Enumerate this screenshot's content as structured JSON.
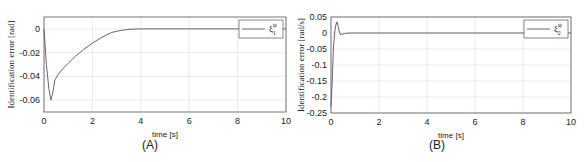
{
  "chart_data": [
    {
      "type": "line",
      "panel_label": "(A)",
      "xlabel": "time [s]",
      "ylabel": "Identification error [rad]",
      "xlim": [
        0,
        10
      ],
      "ylim": [
        -0.07,
        0.01
      ],
      "xticks": [
        "0",
        "2",
        "4",
        "6",
        "8",
        "10"
      ],
      "yticks": [
        "0",
        "-0.02",
        "-0.04",
        "-0.06"
      ],
      "grid": true,
      "legend_position": "upper right",
      "series": [
        {
          "name": "ξ1^ψ",
          "x": [
            0,
            0.1,
            0.2,
            0.28,
            0.35,
            0.45,
            0.6,
            0.8,
            1.0,
            1.3,
            1.6,
            2.0,
            2.4,
            2.8,
            3.2,
            3.6,
            4.0,
            5,
            6,
            7,
            8,
            9,
            10
          ],
          "y": [
            0,
            -0.03,
            -0.05,
            -0.06,
            -0.055,
            -0.043,
            -0.038,
            -0.033,
            -0.029,
            -0.023,
            -0.018,
            -0.012,
            -0.007,
            -0.003,
            -0.0012,
            -0.0003,
            0,
            0,
            0,
            0,
            0,
            0,
            0
          ]
        }
      ]
    },
    {
      "type": "line",
      "panel_label": "(B)",
      "xlabel": "time [s]",
      "ylabel": "Identification error [rad/s]",
      "xlim": [
        0,
        10
      ],
      "ylim": [
        -0.25,
        0.05
      ],
      "xticks": [
        "0",
        "2",
        "4",
        "6",
        "8",
        "10"
      ],
      "yticks": [
        "0.05",
        "0",
        "-0.05",
        "-0.1",
        "-0.15",
        "-0.2",
        "-0.25"
      ],
      "grid": true,
      "legend_position": "upper right",
      "series": [
        {
          "name": "ξ2^ψ",
          "x": [
            0,
            0.05,
            0.1,
            0.15,
            0.2,
            0.25,
            0.3,
            0.35,
            0.4,
            0.5,
            0.6,
            0.8,
            1,
            2,
            4,
            6,
            8,
            10
          ],
          "y": [
            -0.23,
            -0.15,
            -0.05,
            0.0,
            0.025,
            0.035,
            0.02,
            0.003,
            -0.005,
            -0.003,
            -0.001,
            0,
            0,
            0,
            0,
            0,
            0,
            0
          ]
        }
      ]
    }
  ],
  "legend": {
    "a_label": "ξ",
    "a_sup": "ψ",
    "a_sub": "1",
    "b_label": "ξ",
    "b_sup": "ψ",
    "b_sub": "2"
  },
  "captions": {
    "a": "(A)",
    "b": "(B)"
  }
}
